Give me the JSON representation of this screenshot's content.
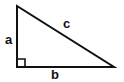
{
  "diagram": {
    "labels": {
      "leg_vertical": "a",
      "leg_horizontal": "b",
      "hypotenuse": "c"
    },
    "vertices": {
      "top": [
        17,
        6
      ],
      "right_angle": [
        17,
        67
      ],
      "right": [
        114,
        67
      ]
    },
    "right_angle_marker": true,
    "colors": {
      "stroke": "#111111",
      "background": "#ffffff"
    }
  }
}
